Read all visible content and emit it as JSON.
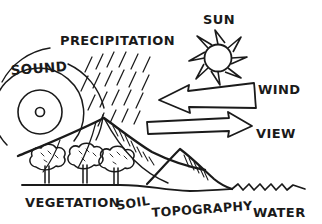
{
  "diagram": {
    "style": "hand-drawn pen sketch, black ink on white paper",
    "background_color": "#ffffff",
    "ink_color": "#1a1a1a"
  },
  "labels": {
    "sound": "SOUND",
    "precipitation": "PRECIPITATION",
    "sun": "SUN",
    "wind": "WIND",
    "view": "VIEW",
    "vegetation": "VEGETATION",
    "soil": "SOIL",
    "topography": "TOPOGRAPHY",
    "water": "WATER"
  },
  "elements": [
    {
      "name": "sound",
      "label": "SOUND",
      "icon": "concentric-rings",
      "description": "small source circle with three concentric arcs radiating outward",
      "position": "left"
    },
    {
      "name": "precipitation",
      "label": "PRECIPITATION",
      "icon": "diagonal-rain-hatching",
      "description": "field of short diagonal strokes falling over the hill",
      "position": "top-center"
    },
    {
      "name": "sun",
      "label": "SUN",
      "icon": "rayed-circle",
      "description": "circle surrounded by triangular rays",
      "position": "top-right"
    },
    {
      "name": "wind",
      "label": "WIND",
      "icon": "left-arrow-banner",
      "description": "wide tapering banner arrow pointing left into the site",
      "position": "right-upper"
    },
    {
      "name": "view",
      "label": "VIEW",
      "icon": "right-arrow",
      "description": "straight outlined arrow pointing right out of the site",
      "position": "right-middle"
    },
    {
      "name": "vegetation",
      "label": "VEGETATION",
      "icon": "tree-cluster",
      "description": "three bushy round-canopy trees on the ground line",
      "position": "bottom-left"
    },
    {
      "name": "soil",
      "label": "SOIL",
      "icon": "ground-line",
      "description": "ground datum line beneath the landform",
      "position": "bottom-center-left"
    },
    {
      "name": "topography",
      "label": "TOPOGRAPHY",
      "icon": "mountain-peaks",
      "description": "hatched mountain and hill profiles",
      "position": "bottom-center-right"
    },
    {
      "name": "water",
      "label": "WATER",
      "icon": "wave-line",
      "description": "zigzag wave line along the right ground edge",
      "position": "bottom-right"
    }
  ]
}
